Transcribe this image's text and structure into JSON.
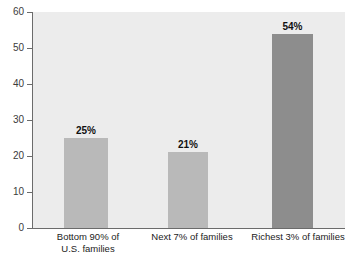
{
  "chart_data": {
    "type": "bar",
    "title": "",
    "subtitle": "",
    "xlabel": "",
    "ylabel": "",
    "ylim": [
      0,
      60
    ],
    "ytick_step": 10,
    "yticks": [
      0,
      10,
      20,
      30,
      40,
      50,
      60
    ],
    "ytick_labels": [
      "0",
      "10",
      "20",
      "30",
      "40",
      "50",
      "60"
    ],
    "grid": false,
    "legend": null,
    "categories": [
      "Bottom 90% of\nU.S. families",
      "Next 7% of families",
      "Richest 3% of families"
    ],
    "values": [
      25,
      21,
      54
    ],
    "value_labels": [
      "25%",
      "21%",
      "54%"
    ],
    "bar_colors": [
      "#b9b9b9",
      "#b9b9b9",
      "#8d8d8d"
    ],
    "plot_background": "#ececec",
    "axis_color": "#6b6b6b",
    "figure_background": "#ffffff"
  }
}
